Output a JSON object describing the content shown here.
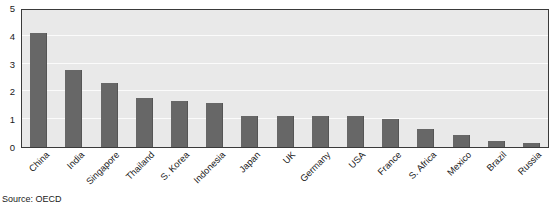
{
  "figure": {
    "source_note": "Source: OECD",
    "title_partial": ""
  },
  "chart_data": {
    "type": "bar",
    "title": "",
    "xlabel": "",
    "ylabel": "",
    "ylim": [
      0,
      5
    ],
    "yticks": [
      0,
      1,
      2,
      3,
      4,
      5
    ],
    "ytick_labels": [
      "0",
      "1",
      "2",
      "3",
      "4",
      "5"
    ],
    "grid": true,
    "legend": false,
    "bar_color": "#676767",
    "plot_background": "#e9e9e9",
    "gridline_color": "#fbfbfb",
    "axis_color": "#3a3a3a",
    "categories": [
      "China",
      "India",
      "Singapore",
      "Thailand",
      "S. Korea",
      "Indonesia",
      "Japan",
      "UK",
      "Germany",
      "USA",
      "France",
      "S. Africa",
      "Mexico",
      "Brazil",
      "Russia"
    ],
    "values": [
      4.1,
      2.78,
      2.3,
      1.75,
      1.65,
      1.58,
      1.12,
      1.12,
      1.1,
      1.1,
      1.02,
      0.65,
      0.42,
      0.2,
      0.15
    ]
  }
}
